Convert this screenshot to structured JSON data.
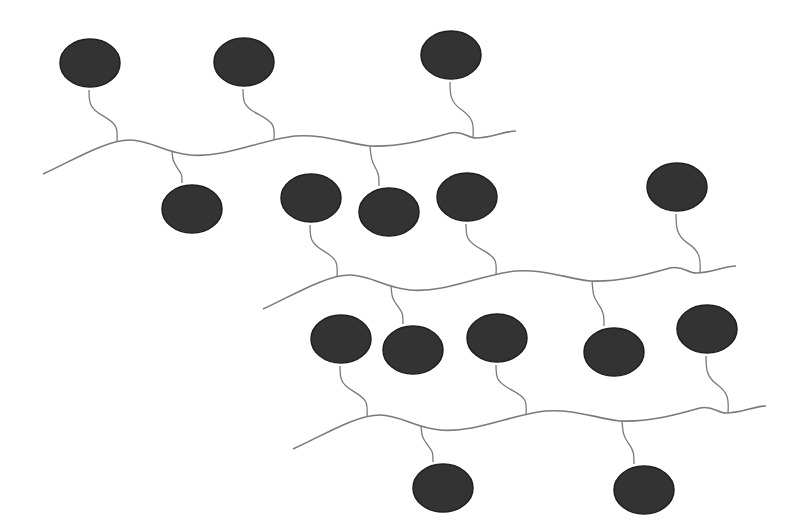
{
  "diagram": {
    "title": "",
    "colors": {
      "background": "#ffffff",
      "chain": "#7a7a7a",
      "sphere_fill": "#333333",
      "sphere_stroke": "#1e1e1e"
    },
    "chain_template": "M43,174 C70,162 105,140 130,140 C150,140 165,153 190,155 C225,158 260,140 295,136 C325,134 345,143 370,146 C400,147 425,140 450,133 C462,130 468,138 476,138 C490,138 505,131 516,131",
    "chains": [
      {
        "id": "chain-1",
        "dx": 0,
        "dy": 0,
        "spheres": [
          {
            "cx": 90,
            "cy": 63,
            "side": "up",
            "attach_x": 117
          },
          {
            "cx": 244,
            "cy": 62,
            "side": "up",
            "attach_x": 274
          },
          {
            "cx": 451,
            "cy": 55,
            "side": "up",
            "attach_x": 473
          },
          {
            "cx": 192,
            "cy": 209,
            "side": "down",
            "attach_x": 172
          },
          {
            "cx": 389,
            "cy": 212,
            "side": "down",
            "attach_x": 370
          }
        ]
      },
      {
        "id": "chain-2",
        "dx": 220,
        "dy": 135,
        "spheres": [
          {
            "cx": 311,
            "cy": 198,
            "side": "up",
            "attach_x": 337
          },
          {
            "cx": 467,
            "cy": 197,
            "side": "up",
            "attach_x": 496
          },
          {
            "cx": 677,
            "cy": 187,
            "side": "up",
            "attach_x": 700
          },
          {
            "cx": 413,
            "cy": 350,
            "side": "down",
            "attach_x": 391
          },
          {
            "cx": 614,
            "cy": 352,
            "side": "down",
            "attach_x": 592
          }
        ]
      },
      {
        "id": "chain-3",
        "dx": 250,
        "dy": 275,
        "spheres": [
          {
            "cx": 341,
            "cy": 339,
            "side": "up",
            "attach_x": 367
          },
          {
            "cx": 497,
            "cy": 338,
            "side": "up",
            "attach_x": 526
          },
          {
            "cx": 707,
            "cy": 329,
            "side": "up",
            "attach_x": 728
          },
          {
            "cx": 443,
            "cy": 488,
            "side": "down",
            "attach_x": 421
          },
          {
            "cx": 644,
            "cy": 490,
            "side": "down",
            "attach_x": 622
          }
        ]
      }
    ]
  }
}
